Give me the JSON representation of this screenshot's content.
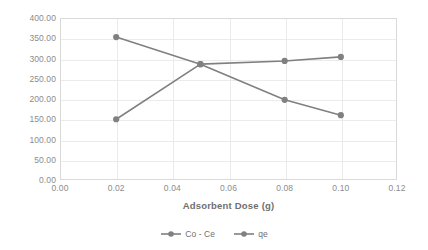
{
  "chart_data": {
    "type": "line",
    "title": "",
    "xlabel": "Adsorbent Dose (g)",
    "ylabel": "",
    "x": [
      0.02,
      0.05,
      0.08,
      0.1
    ],
    "series": [
      {
        "name": "Co - Ce",
        "values": [
          353,
          286,
          198,
          160
        ],
        "color": "#808080"
      },
      {
        "name": "qe",
        "values": [
          150,
          286,
          294,
          304
        ],
        "color": "#808080"
      }
    ],
    "xlim": [
      0.0,
      0.12
    ],
    "ylim": [
      0.0,
      400.0
    ],
    "xticks": [
      "0.00",
      "0.02",
      "0.04",
      "0.06",
      "0.08",
      "0.10",
      "0.12"
    ],
    "xtick_values": [
      0.0,
      0.02,
      0.04,
      0.06,
      0.08,
      0.1,
      0.12
    ],
    "yticks": [
      "0.00",
      "50.00",
      "100.00",
      "150.00",
      "200.00",
      "250.00",
      "300.00",
      "350.00",
      "400.00"
    ],
    "ytick_values": [
      0,
      50,
      100,
      150,
      200,
      250,
      300,
      350,
      400
    ],
    "grid": true,
    "legend_position": "bottom",
    "marker": "circle",
    "colors": {
      "series": "#808080",
      "grid": "#eceaea",
      "axis_text": "#8c8c8c",
      "title_text": "#6f6f6f",
      "plot_border": "#d9d9d9",
      "background": "#ffffff"
    }
  },
  "legend": {
    "items": [
      {
        "label": "Co - Ce"
      },
      {
        "label": "qe"
      }
    ]
  }
}
